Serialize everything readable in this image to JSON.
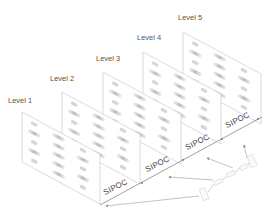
{
  "diagram": {
    "type": "isometric-stacked-layers",
    "levels": [
      {
        "label": "Level 1",
        "x": 8,
        "y": 96
      },
      {
        "label": "Level 2",
        "x": 50,
        "y": 74
      },
      {
        "label": "Level 3",
        "x": 96,
        "y": 54
      },
      {
        "label": "Level 4",
        "x": 137,
        "y": 33
      },
      {
        "label": "Level 5",
        "x": 178,
        "y": 13
      }
    ],
    "axis_labels": [
      {
        "label": "SIPOC",
        "x": 104,
        "y": 198
      },
      {
        "label": "SIPOC",
        "x": 152,
        "y": 170
      },
      {
        "label": "SIPOC",
        "x": 193,
        "y": 147
      },
      {
        "label": "SIPOC",
        "x": 232,
        "y": 125
      }
    ],
    "colors": {
      "line": "#888888",
      "panel_border": "#bdbdbd",
      "shape_fill": "#d9d9d9",
      "text": "#555555"
    }
  }
}
